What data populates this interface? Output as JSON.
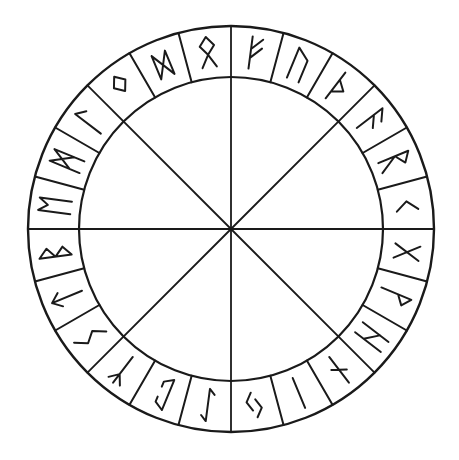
{
  "diagram": {
    "title": "Rune circle",
    "ink_color": "#1a1a1a",
    "background": "#ffffff",
    "center": [
      231,
      229
    ],
    "outer_radius": 203,
    "inner_radius": 152,
    "spokes": 8,
    "cells_per_octant": 3,
    "runes": [
      {
        "index": 0,
        "name": "fehu",
        "glyph": "ᚠ"
      },
      {
        "index": 1,
        "name": "uruz",
        "glyph": "ᚢ"
      },
      {
        "index": 2,
        "name": "thurisaz",
        "glyph": "ᚦ"
      },
      {
        "index": 3,
        "name": "ansuz",
        "glyph": "ᚨ"
      },
      {
        "index": 4,
        "name": "raidho",
        "glyph": "ᚱ"
      },
      {
        "index": 5,
        "name": "kenaz",
        "glyph": "ᚲ"
      },
      {
        "index": 6,
        "name": "gebo",
        "glyph": "ᚷ"
      },
      {
        "index": 7,
        "name": "wunjo",
        "glyph": "ᚹ"
      },
      {
        "index": 8,
        "name": "hagalaz",
        "glyph": "ᚺ"
      },
      {
        "index": 9,
        "name": "naudhiz",
        "glyph": "ᚾ"
      },
      {
        "index": 10,
        "name": "isa",
        "glyph": "ᛁ"
      },
      {
        "index": 11,
        "name": "jera",
        "glyph": "ᛃ"
      },
      {
        "index": 12,
        "name": "eihwaz",
        "glyph": "ᛇ"
      },
      {
        "index": 13,
        "name": "perthro",
        "glyph": "ᛈ"
      },
      {
        "index": 14,
        "name": "algiz",
        "glyph": "ᛉ"
      },
      {
        "index": 15,
        "name": "sowilo",
        "glyph": "ᛊ"
      },
      {
        "index": 16,
        "name": "tiwaz",
        "glyph": "ᛏ"
      },
      {
        "index": 17,
        "name": "berkano",
        "glyph": "ᛒ"
      },
      {
        "index": 18,
        "name": "ehwaz",
        "glyph": "ᛖ"
      },
      {
        "index": 19,
        "name": "mannaz",
        "glyph": "ᛗ"
      },
      {
        "index": 20,
        "name": "laguz",
        "glyph": "ᛚ"
      },
      {
        "index": 21,
        "name": "ingwaz",
        "glyph": "ᛜ"
      },
      {
        "index": 22,
        "name": "dagaz",
        "glyph": "ᛞ"
      },
      {
        "index": 23,
        "name": "othala",
        "glyph": "ᛟ"
      }
    ]
  }
}
